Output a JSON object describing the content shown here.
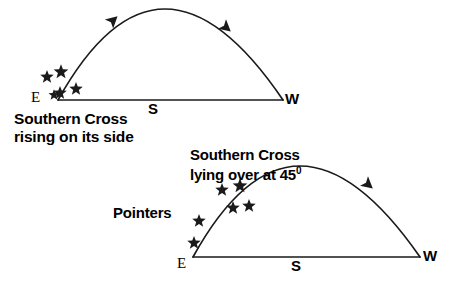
{
  "figure": {
    "title_upper_line1": "Southern Cross",
    "title_upper_line2": "rising on its side",
    "title_lower_line1": "Southern Cross",
    "title_lower_line2": "lying over at 45",
    "title_lower_degree": "0",
    "pointers_label": "Pointers"
  },
  "upper_diagram": {
    "dir_east": "E",
    "dir_south": "S",
    "dir_west": "W",
    "horizon": {
      "x1": 58,
      "y1": 100,
      "x2": 283,
      "y2": 100
    },
    "arc": {
      "start_x": 58,
      "start_y": 100,
      "apex_x": 165,
      "apex_y": 9,
      "end_x": 283,
      "end_y": 100
    },
    "arrows": [
      {
        "x": 109,
        "y": 24,
        "angle": -42
      },
      {
        "x": 222,
        "y": 24,
        "angle": 40
      }
    ],
    "stars": [
      {
        "x": 47,
        "y": 77,
        "size": 11
      },
      {
        "x": 61,
        "y": 72,
        "size": 12
      },
      {
        "x": 60,
        "y": 93,
        "size": 11
      },
      {
        "x": 76,
        "y": 89,
        "size": 11
      },
      {
        "x": 54,
        "y": 95,
        "size": 9
      }
    ]
  },
  "lower_diagram": {
    "dir_east": "E",
    "dir_south": "S",
    "dir_west": "W",
    "horizon": {
      "x1": 193,
      "y1": 257,
      "x2": 420,
      "y2": 257
    },
    "arc": {
      "start_x": 193,
      "start_y": 257,
      "apex_x": 300,
      "apex_y": 166,
      "end_x": 420,
      "end_y": 257
    },
    "arrows": [
      {
        "x": 364,
        "y": 181,
        "angle": 40
      }
    ],
    "cross_stars": [
      {
        "x": 222,
        "y": 190,
        "size": 11
      },
      {
        "x": 240,
        "y": 186,
        "size": 12
      },
      {
        "x": 233,
        "y": 208,
        "size": 11
      },
      {
        "x": 249,
        "y": 206,
        "size": 11
      }
    ],
    "pointer_stars": [
      {
        "x": 199,
        "y": 221,
        "size": 11
      },
      {
        "x": 194,
        "y": 243,
        "size": 11
      }
    ]
  },
  "style": {
    "stroke": "#1a1a1a",
    "text_color": "#000000",
    "background": "#ffffff"
  }
}
